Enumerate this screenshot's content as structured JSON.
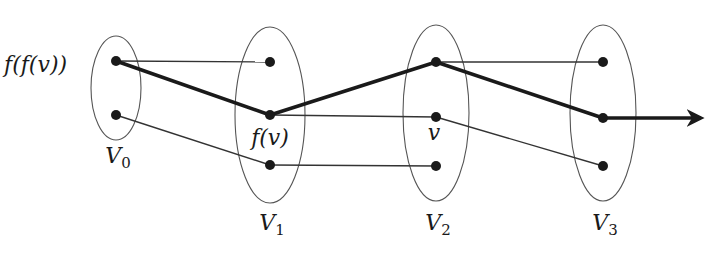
{
  "diagram": {
    "colors": {
      "stroke": "#1a1a1a",
      "thin_line": "#333333",
      "ellipse": "#555555",
      "background": "#ffffff"
    },
    "sets": [
      {
        "id": "V0",
        "name": "V",
        "sub": "0",
        "cx": 116,
        "cy": 88,
        "rx": 25,
        "ry": 52,
        "label_x": 118,
        "label_y": 163
      },
      {
        "id": "V1",
        "name": "V",
        "sub": "1",
        "cx": 270,
        "cy": 115,
        "rx": 35,
        "ry": 88,
        "label_x": 272,
        "label_y": 230
      },
      {
        "id": "V2",
        "name": "V",
        "sub": "2",
        "cx": 436,
        "cy": 113,
        "rx": 33,
        "ry": 88,
        "label_x": 438,
        "label_y": 230
      },
      {
        "id": "V3",
        "name": "V",
        "sub": "3",
        "cx": 603,
        "cy": 113,
        "rx": 33,
        "ry": 88,
        "label_x": 605,
        "label_y": 230
      }
    ],
    "nodes": [
      {
        "id": "a0",
        "x": 116,
        "y": 61
      },
      {
        "id": "a1",
        "x": 116,
        "y": 115
      },
      {
        "id": "b0",
        "x": 270,
        "y": 62
      },
      {
        "id": "b1",
        "x": 270,
        "y": 115
      },
      {
        "id": "b2",
        "x": 270,
        "y": 165
      },
      {
        "id": "c0",
        "x": 436,
        "y": 62
      },
      {
        "id": "c1",
        "x": 436,
        "y": 117
      },
      {
        "id": "c2",
        "x": 436,
        "y": 166
      },
      {
        "id": "d0",
        "x": 603,
        "y": 62
      },
      {
        "id": "d1",
        "x": 603,
        "y": 118
      },
      {
        "id": "d2",
        "x": 603,
        "y": 166
      }
    ],
    "thin_edges": [
      [
        "a0",
        "b0"
      ],
      [
        "a1",
        "b2"
      ],
      [
        "b1",
        "c1"
      ],
      [
        "b2",
        "c2"
      ],
      [
        "c0",
        "d0"
      ],
      [
        "c1",
        "d2"
      ]
    ],
    "path_edges": [
      [
        "a0",
        "b1"
      ],
      [
        "b1",
        "c0"
      ],
      [
        "c0",
        "d1"
      ]
    ],
    "arrow": {
      "from": [
        603,
        118
      ],
      "to": [
        707,
        118
      ]
    },
    "node_labels": [
      {
        "text": "f(f(v))",
        "x": 4,
        "y": 72,
        "anchor": "start"
      },
      {
        "text": "f(v)",
        "x": 270,
        "y": 145,
        "anchor": "middle"
      },
      {
        "text": "v",
        "x": 434,
        "y": 140,
        "anchor": "middle"
      }
    ]
  }
}
